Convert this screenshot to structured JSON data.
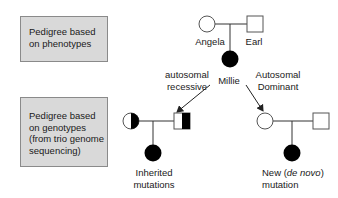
{
  "panels": {
    "phenotype_box": {
      "lines": [
        "Pedigree based",
        "on phenotypes"
      ]
    },
    "genotype_box": {
      "lines": [
        "Pedigree based",
        "on genotypes",
        "(from trio genome",
        "sequencing)"
      ]
    }
  },
  "top_pedigree": {
    "mother": {
      "name": "Angela",
      "symbol": "circle-unaffected"
    },
    "father": {
      "name": "Earl",
      "symbol": "square-unaffected"
    },
    "child": {
      "name": "Millie",
      "symbol": "circle-affected"
    }
  },
  "branches": {
    "left": {
      "label_lines": [
        "autosomal",
        "recessive"
      ]
    },
    "right": {
      "label_lines": [
        "Autosomal",
        "Dominant"
      ]
    }
  },
  "bottom_left_pedigree": {
    "mother": {
      "symbol": "circle-carrier-half-filled"
    },
    "father": {
      "symbol": "square-carrier-half-filled"
    },
    "child": {
      "symbol": "circle-affected"
    },
    "caption_lines": [
      "Inherited",
      "mutations"
    ]
  },
  "bottom_right_pedigree": {
    "mother": {
      "symbol": "circle-unaffected"
    },
    "father": {
      "symbol": "square-unaffected"
    },
    "child": {
      "symbol": "circle-affected"
    },
    "caption_line1_prefix": "New (",
    "caption_line1_italic": "de novo",
    "caption_line1_suffix": ")",
    "caption_line2": "mutation"
  },
  "colors": {
    "box_fill": "#d9d9d9",
    "box_border": "#8a8a8a",
    "affected": "#000000",
    "line": "#333333"
  }
}
